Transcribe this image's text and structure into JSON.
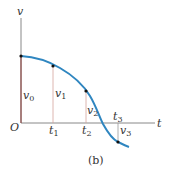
{
  "figure": {
    "caption": "(b)",
    "axes": {
      "y_label": "v",
      "x_label": "t",
      "origin_label": "O"
    },
    "time_marks": [
      {
        "name": "t",
        "sub": "1"
      },
      {
        "name": "t",
        "sub": "2"
      },
      {
        "name": "t",
        "sub": "3"
      }
    ],
    "velocity_marks": [
      {
        "name": "v",
        "sub": "0"
      },
      {
        "name": "v",
        "sub": "1"
      },
      {
        "name": "v",
        "sub": "2"
      },
      {
        "name": "v",
        "sub": "3"
      }
    ],
    "colors": {
      "curve": "#2f86c0",
      "axis": "#777777",
      "ordinates": "#c98a82",
      "points": "#111111"
    }
  }
}
